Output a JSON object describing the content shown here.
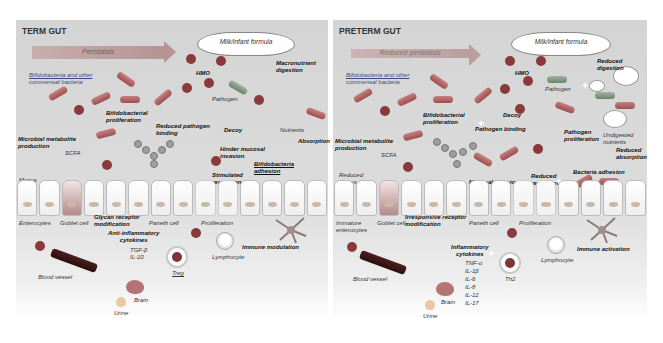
{
  "term": {
    "title": "TERM GUT",
    "peristalsis": "Peristalsis",
    "cloud": "Milk/infant formula",
    "labels": {
      "bacteria": "Bifidobacteria and other commensal bacteria",
      "hmo": "HMO",
      "macronutrient": "Macronutrient digestion",
      "pathogen": "Pathogen",
      "bifido_prolif": "Bifidobacterial proliferation",
      "reduced_pathogen_binding": "Reduced pathogen binding",
      "decoy": "Decoy",
      "nutrients": "Nutrients",
      "absorption": "Absorption",
      "microbial_metabolite": "Microbial metabolite production",
      "scfa": "SCFA",
      "hinder_mucosal": "Hinder mucosal invasion",
      "bifido_adhesion": "Bifidobacteria adhesion",
      "stimulated_restitution": "Stimulated restitution",
      "mucus": "Mucus",
      "enterocytes": "Enterocytes",
      "goblet": "Goblet cell",
      "glycan": "Glycan receptor modification",
      "paneth": "Paneth cell",
      "proliferation": "Proliferation",
      "immune_modulation": "Immune modulation",
      "lymphocyte": "Lymphocyte",
      "anti_inflammatory": "Anti-inflammatory cytokines",
      "cytokines": [
        "TGF-β",
        "IL-10"
      ],
      "treg": "Treg",
      "blood_vessel": "Blood vessel",
      "brain": "Brain",
      "urine": "Urine"
    }
  },
  "preterm": {
    "title": "PRETERM GUT",
    "peristalsis": "Reduced peristalsis",
    "cloud": "Milk/infant formula",
    "labels": {
      "bacteria": "Bifidobacteria and other commensal bacteria",
      "hmo": "HMO",
      "reduced_digestion": "Reduced digestion",
      "pathogen": "Pathogen",
      "decoy": "Decoy",
      "bifido_prolif": "Bifidobacterial proliferation",
      "pathogen_binding": "Pathogen binding",
      "pathogen_prolif": "Pathogen proliferation",
      "undigested": "Undigested nutrients",
      "reduced_absorption": "Reduced absorption",
      "microbial_metabolite": "Microbial metabolite production",
      "scfa": "SCFA",
      "reduced_mucus": "Reduced mucus",
      "mucosal_invasion": "Mucosal invasion",
      "reduced_restitution": "Reduced restitution",
      "bacteria_adhesion": "Bacteria adhesion",
      "immature_enterocytes": "Immature enterocytes",
      "goblet": "Goblet cell",
      "irresponsive": "Irresponsive receptor modification",
      "paneth": "Paneth cell",
      "proliferation": "Proliferation",
      "immune_activation": "Immune activation",
      "lymphocyte": "Lymphocyte",
      "inflammatory": "Inflammatory cytokines",
      "cytokines": [
        "TNF-α",
        "IL-1β",
        "IL-6",
        "IL-8",
        "IL-12",
        "IL-17"
      ],
      "th2": "Th2",
      "blood_vessel": "Blood vessel",
      "brain": "Brain",
      "urine": "Urine"
    }
  }
}
